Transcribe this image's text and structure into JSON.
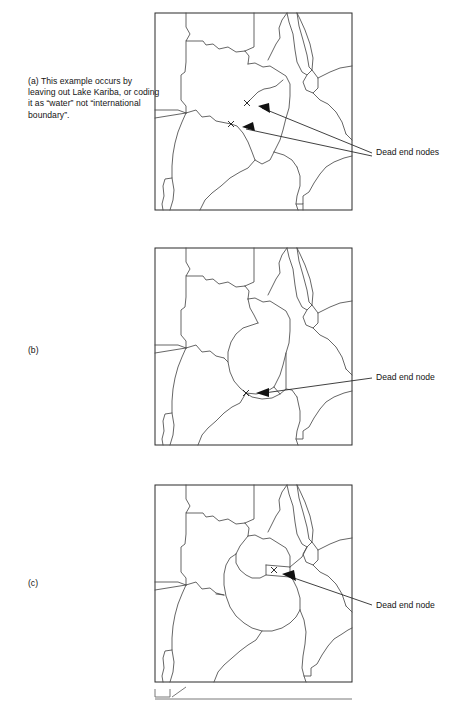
{
  "figure": {
    "type": "diagram",
    "panel_count": 3,
    "background_color": "#ffffff",
    "line_color": "#4a4a4a",
    "frame_color": "#2b2b2b",
    "marker_color": "#111111"
  },
  "panels": [
    {
      "id": "a",
      "label": "(a)",
      "caption_index": "(a)",
      "caption_body": "This example occurs by leaving out Lake Kariba, or coding it as “water” not “international boundary”.",
      "caption_lines": [
        "This example occurs",
        "by leaving out Lake",
        "Kariba, or coding it",
        "as “water” not",
        "“international boundary”."
      ],
      "annotation": "Dead end nodes",
      "dead_end_count": 2,
      "markers": [
        {
          "symbol": "x",
          "x": 247,
          "y": 103
        },
        {
          "symbol": "x",
          "x": 231,
          "y": 124
        }
      ],
      "frame": {
        "x": 155,
        "y": 13,
        "width": 197,
        "height": 197
      }
    },
    {
      "id": "b",
      "label": "(b)",
      "caption_index": "(b)",
      "caption_body": "",
      "caption_lines": [],
      "annotation": "Dead end node",
      "dead_end_count": 1,
      "markers": [
        {
          "symbol": "x",
          "x": 246,
          "y": 393
        }
      ],
      "frame": {
        "x": 155,
        "y": 248,
        "width": 197,
        "height": 197
      }
    },
    {
      "id": "c",
      "label": "(c)",
      "caption_index": "(c)",
      "caption_body": "",
      "caption_lines": [],
      "annotation": "Dead end node",
      "dead_end_count": 1,
      "markers": [
        {
          "symbol": "x",
          "x": 274,
          "y": 570
        }
      ],
      "frame": {
        "x": 155,
        "y": 485,
        "width": 197,
        "height": 197
      }
    }
  ]
}
